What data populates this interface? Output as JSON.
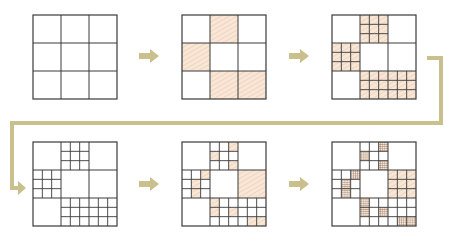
{
  "diagram": {
    "colors": {
      "line": "#3a3a3a",
      "fill": "#f8e6d6",
      "hatch": "#e9c6a8",
      "fine_hatch": "#7a5a4a",
      "arrow": "#c9c08e",
      "background": "#ffffff"
    },
    "grid_size_px": 84,
    "stages": [
      {
        "id": 1,
        "x": 33,
        "y": 15,
        "label": "stage-1",
        "cells": [],
        "subdivided": [],
        "sub_shaded": {},
        "sub_hatched": {}
      },
      {
        "id": 2,
        "x": 182,
        "y": 15,
        "label": "stage-2",
        "cells": [
          "0,1",
          "1,0",
          "2,1",
          "2,2"
        ],
        "subdivided": [],
        "sub_shaded": {},
        "sub_hatched": {}
      },
      {
        "id": 3,
        "x": 332,
        "y": 15,
        "label": "stage-3",
        "cells": [
          "0,1",
          "1,0",
          "2,1",
          "2,2"
        ],
        "subdivided": [
          "0,1",
          "1,0",
          "2,1",
          "2,2"
        ],
        "sub_shaded": {
          "0,1": "all",
          "1,0": "all",
          "2,1": "all",
          "2,2": "all"
        },
        "sub_hatched": {}
      },
      {
        "id": 4,
        "x": 33,
        "y": 142,
        "label": "stage-4",
        "cells": [],
        "subdivided": [
          "0,1",
          "1,0",
          "2,1",
          "2,2"
        ],
        "sub_shaded": {},
        "sub_hatched": {}
      },
      {
        "id": 5,
        "x": 182,
        "y": 142,
        "label": "stage-5",
        "cells": [
          "1,2"
        ],
        "subdivided": [
          "0,1",
          "1,0",
          "2,1",
          "2,2"
        ],
        "sub_shaded": {
          "0,1": [
            "0,2",
            "1,0",
            "2,2"
          ],
          "1,0": [
            "0,2",
            "1,1",
            "2,1"
          ],
          "2,1": [
            "0,0",
            "1,0",
            "1,2"
          ],
          "2,2": [
            "2,1",
            "2,2"
          ]
        },
        "sub_hatched": {}
      },
      {
        "id": 6,
        "x": 332,
        "y": 142,
        "label": "stage-6",
        "cells": [
          "1,2"
        ],
        "subdivided": [
          "0,1",
          "1,0",
          "2,1",
          "2,2",
          "1,2"
        ],
        "sub_shaded": {
          "1,2": "all"
        },
        "sub_hatched": {
          "0,1": [
            "0,2",
            "1,0",
            "2,2"
          ],
          "1,0": [
            "0,2",
            "1,1",
            "2,1"
          ],
          "2,1": [
            "0,0",
            "1,0",
            "1,2"
          ],
          "2,2": [
            "2,1",
            "2,2"
          ]
        }
      }
    ],
    "arrows": [
      {
        "x": 138,
        "y": 48,
        "direction": "right"
      },
      {
        "x": 288,
        "y": 48,
        "direction": "right"
      },
      {
        "x": 138,
        "y": 176,
        "direction": "right"
      },
      {
        "x": 288,
        "y": 176,
        "direction": "right"
      }
    ],
    "connector": {
      "points": [
        [
          427,
          58
        ],
        [
          441,
          58
        ],
        [
          441,
          123
        ],
        [
          12,
          123
        ],
        [
          12,
          188
        ]
      ],
      "end_arrow_at": [
        26,
        188
      ]
    }
  }
}
